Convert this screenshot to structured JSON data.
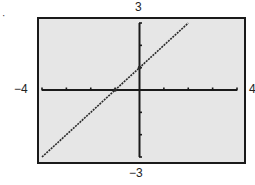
{
  "figure": {
    "marker": "·",
    "labels": {
      "ymax": "3",
      "ymin": "−3",
      "xmin": "−4",
      "xmax": "4"
    },
    "colors": {
      "background": "#e6e6e6",
      "frame": "#1a1a1a",
      "axes": "#1a1a1a",
      "line": "#2a2a2a"
    }
  },
  "chart_data": {
    "type": "line",
    "title": "",
    "xlabel": "",
    "ylabel": "",
    "xlim": [
      -4,
      4
    ],
    "ylim": [
      -3,
      3
    ],
    "xscale_ticks": 1,
    "yscale_ticks": 1,
    "x_tick_values": [
      -4,
      -3,
      -2,
      -1,
      0,
      1,
      2,
      3,
      4
    ],
    "y_tick_values": [
      -3,
      -2,
      -1,
      0,
      1,
      2,
      3
    ],
    "window_labels": {
      "xmin": "-4",
      "xmax": "4",
      "ymin": "-3",
      "ymax": "3"
    },
    "grid": false,
    "legend": null,
    "series": [
      {
        "name": "y = x + 1",
        "style": "dotted",
        "x": [
          -4,
          -3,
          -2,
          -1,
          0,
          1,
          2
        ],
        "y": [
          -3,
          -2,
          -1,
          0,
          1,
          2,
          3
        ]
      }
    ],
    "intercepts": {
      "x_intercept": -1,
      "y_intercept": 1
    }
  }
}
